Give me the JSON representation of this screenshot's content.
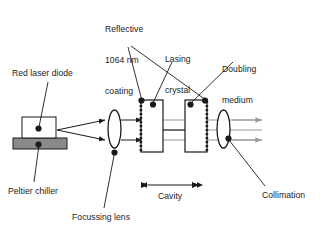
{
  "figure": {
    "background_color": "#ffffff",
    "ink_color": "#1a1a1a",
    "beam_color": "#9a9a9a",
    "chiller_color": "#8a8a8a"
  },
  "labels": {
    "reflective_coating": {
      "line1": "Reflective",
      "line2": "1064 nm",
      "line3": "coating"
    },
    "lasing_crystal": {
      "line1": "Lasing",
      "line2": "crystal"
    },
    "doubling_medium": {
      "line1": "Doubling",
      "line2": "medium"
    },
    "red_laser_diode": "Red laser diode",
    "peltier_chiller": "Peltier chiller",
    "focussing_lens": "Focussing lens",
    "cavity": "Cavity",
    "collimation": "Collimation"
  },
  "components": [
    {
      "name": "red-laser-diode",
      "shape": "rect",
      "fill": "#ffffff"
    },
    {
      "name": "peltier-chiller",
      "shape": "rect",
      "fill": "#8a8a8a"
    },
    {
      "name": "focussing-lens",
      "shape": "ellipse",
      "fill": "#ffffff"
    },
    {
      "name": "lasing-crystal",
      "shape": "rect",
      "fill": "#ffffff",
      "coating_edge": "left"
    },
    {
      "name": "doubling-medium",
      "shape": "rect",
      "fill": "#ffffff",
      "coating_edge": "right"
    },
    {
      "name": "collimation-lens",
      "shape": "ellipse",
      "fill": "#ffffff"
    }
  ],
  "annotations": {
    "cavity_span": "between lasing crystal left face and doubling medium right face",
    "output_beams": 2,
    "pump_beams": 2
  }
}
